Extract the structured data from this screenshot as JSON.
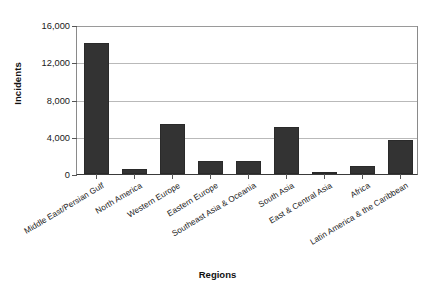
{
  "chart_data": {
    "type": "bar",
    "title": "",
    "xlabel": "Regions",
    "ylabel": "Incidents",
    "categories": [
      "Middle East/Persian Gulf",
      "North America",
      "Western Europe",
      "Eastern Europe",
      "Southeast Asia & Oceania",
      "South Asia",
      "East & Central Asia",
      "Africa",
      "Latin America & the Caribbean"
    ],
    "values": [
      14100,
      500,
      5400,
      1400,
      1350,
      5050,
      200,
      900,
      3600
    ],
    "ylim": [
      0,
      16000
    ],
    "ytick_labels": [
      "0",
      "4,000",
      "8,000",
      "12,000",
      "16,000"
    ],
    "ytick_values": [
      0,
      4000,
      8000,
      12000,
      16000
    ],
    "grid": "horizontal",
    "legend": "none",
    "bar_color": "#333333",
    "gridline_color": "#b9b9b9",
    "axis_color": "#555555"
  }
}
